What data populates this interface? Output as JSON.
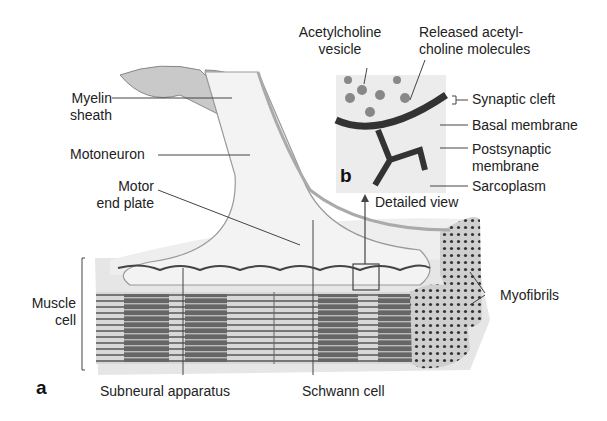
{
  "figure": {
    "panel_a": "a",
    "panel_b": "b",
    "labels": {
      "myelin_sheath_1": "Myelin",
      "myelin_sheath_2": "sheath",
      "motoneuron": "Motoneuron",
      "motor_end_plate_1": "Motor",
      "motor_end_plate_2": "end plate",
      "muscle_cell_1": "Muscle",
      "muscle_cell_2": "cell",
      "subneural_apparatus": "Subneural apparatus",
      "schwann_cell": "Schwann cell",
      "myofibrils": "Myofibrils",
      "detailed_view": "Detailed view",
      "acetylcholine_vesicle_1": "Acetylcholine",
      "acetylcholine_vesicle_2": "vesicle",
      "released_ach_1": "Released acetyl-",
      "released_ach_2": "choline molecules",
      "synaptic_cleft": "Synaptic cleft",
      "basal_membrane": "Basal membrane",
      "postsynaptic_membrane_1": "Postsynaptic",
      "postsynaptic_membrane_2": "membrane",
      "sarcoplasm": "Sarcoplasm"
    }
  }
}
